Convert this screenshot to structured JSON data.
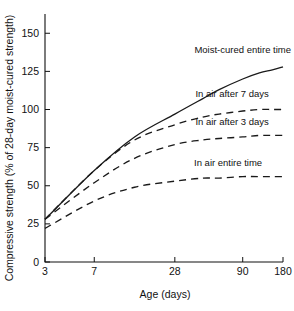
{
  "chart_data": {
    "type": "line",
    "title": "",
    "xlabel": "Age (days)",
    "ylabel": "Compressive strength (% of 28-day moist-cured strength)",
    "x_scale": "log-compressed",
    "xticks": [
      3,
      7,
      28,
      90,
      180
    ],
    "xtick_labels": [
      "3",
      "7",
      "28",
      "90",
      "180"
    ],
    "yticks": [
      0,
      25,
      50,
      75,
      100,
      125,
      150
    ],
    "ytick_labels": [
      "0",
      "25",
      "50",
      "75",
      "100",
      "125",
      "150"
    ],
    "xlim": [
      3,
      180
    ],
    "ylim": [
      0,
      160
    ],
    "grid": false,
    "legend_position": "inline-annotations",
    "series": [
      {
        "name": "Moist-cured entire time",
        "style": "solid",
        "label_x": 90,
        "label_y": 137,
        "x": [
          3,
          7,
          14,
          28,
          45,
          60,
          90,
          120,
          150,
          180
        ],
        "y": [
          28,
          60,
          82,
          97,
          107,
          113,
          120,
          124,
          126,
          128
        ]
      },
      {
        "name": "In air after 7 days",
        "style": "dashed",
        "label_x": 75,
        "label_y": 108,
        "x": [
          3,
          7,
          14,
          28,
          45,
          60,
          90,
          120,
          150,
          180
        ],
        "y": [
          28,
          60,
          80,
          90,
          95,
          97,
          99,
          100,
          100,
          100
        ]
      },
      {
        "name": "In air after 3 days",
        "style": "dashed",
        "label_x": 75,
        "label_y": 90,
        "x": [
          3,
          7,
          14,
          28,
          45,
          60,
          90,
          120,
          150,
          180
        ],
        "y": [
          28,
          52,
          68,
          77,
          80,
          81,
          82,
          83,
          83,
          83
        ]
      },
      {
        "name": "In air entire time",
        "style": "dashed",
        "label_x": 70,
        "label_y": 63,
        "x": [
          3,
          7,
          14,
          28,
          45,
          60,
          90,
          120,
          150,
          180
        ],
        "y": [
          22,
          40,
          49,
          53,
          55,
          55,
          56,
          56,
          56,
          56
        ]
      }
    ]
  }
}
